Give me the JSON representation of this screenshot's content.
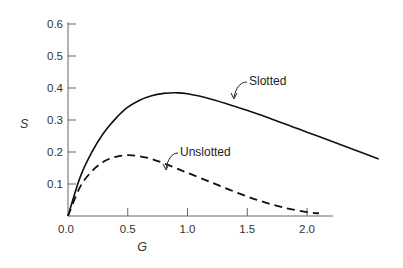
{
  "chart_data": {
    "type": "line",
    "title": "",
    "xlabel": "G",
    "ylabel": "S",
    "xlim": [
      0,
      2.6
    ],
    "ylim": [
      0,
      0.6
    ],
    "x_ticks": [
      "0.0",
      "0.5",
      "1.0",
      "1.5",
      "2.0"
    ],
    "y_ticks": [
      "0.1",
      "0.2",
      "0.3",
      "0.4",
      "0.5",
      "0.6"
    ],
    "grid": false,
    "legend": "inline labels with arrows",
    "series": [
      {
        "name": "Slotted",
        "style": "solid",
        "x": [
          0,
          0.1,
          0.2,
          0.3,
          0.4,
          0.5,
          0.6,
          0.7,
          0.8,
          0.9,
          1.0,
          1.2,
          1.4,
          1.6,
          1.8,
          2.0,
          2.2,
          2.4,
          2.6
        ],
        "y": [
          0,
          0.12,
          0.2,
          0.26,
          0.305,
          0.34,
          0.362,
          0.376,
          0.383,
          0.385,
          0.382,
          0.365,
          0.342,
          0.317,
          0.29,
          0.262,
          0.234,
          0.206,
          0.178
        ]
      },
      {
        "name": "Unslotted",
        "style": "dashed",
        "x": [
          0,
          0.1,
          0.2,
          0.3,
          0.4,
          0.5,
          0.6,
          0.7,
          0.8,
          0.9,
          1.0,
          1.2,
          1.4,
          1.6,
          1.8,
          2.0,
          2.1
        ],
        "y": [
          0,
          0.09,
          0.14,
          0.17,
          0.185,
          0.19,
          0.187,
          0.178,
          0.165,
          0.15,
          0.135,
          0.105,
          0.075,
          0.048,
          0.027,
          0.012,
          0.008
        ]
      }
    ]
  },
  "labels": {
    "x_axis": "G",
    "y_axis": "S",
    "origin": "0.0",
    "slotted": "Slotted",
    "unslotted": "Unslotted"
  }
}
